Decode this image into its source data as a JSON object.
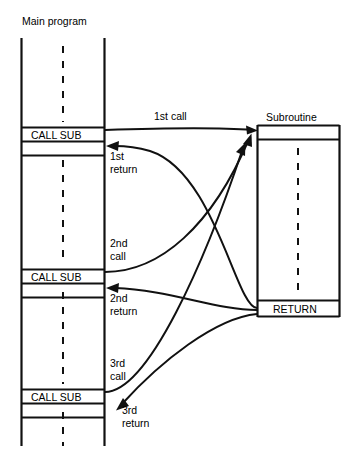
{
  "figure": {
    "type": "control-flow-diagram",
    "background": "#ffffff",
    "line_color": "#111111",
    "text_color": "#000000"
  },
  "headers": {
    "main_program": "Main program",
    "subroutine": "Subroutine"
  },
  "main_program": {
    "call_boxes": [
      {
        "id": "call-sub-1",
        "label": "CALL SUB"
      },
      {
        "id": "call-sub-2",
        "label": "CALL SUB"
      },
      {
        "id": "call-sub-3",
        "label": "CALL SUB"
      }
    ]
  },
  "subroutine": {
    "return_box": {
      "id": "return-box",
      "label": "RETURN"
    }
  },
  "flow_labels": {
    "call_1": "1st call",
    "return_1_line1": "1st",
    "return_1_line2": "return",
    "call_2_line1": "2nd",
    "call_2_line2": "call",
    "return_2_line1": "2nd",
    "return_2_line2": "return",
    "call_3_line1": "3rd",
    "call_3_line2": "call",
    "return_3_line1": "3rd",
    "return_3_line2": "return"
  }
}
